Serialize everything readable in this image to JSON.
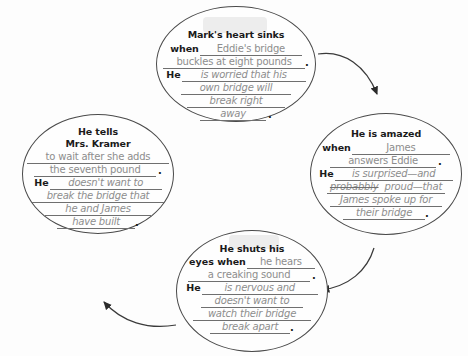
{
  "worksheet": {
    "title": "Character response graphic organizer",
    "arrow_color": "#3a3a3a",
    "bubble_border_color": "#4a4a4a",
    "handwriting_color": "#8d8d8d",
    "print_color": "#1a1a1a",
    "background_color": "#fdfdfd"
  },
  "bubbles": {
    "top": {
      "name": "marks-heart-sinks-bubble",
      "title": "Mark's heart sinks",
      "lines": [
        {
          "lead": "when",
          "fill": "Eddie's bridge",
          "style": "upright",
          "end": ""
        },
        {
          "lead": "",
          "fill": "buckles at eight pounds",
          "style": "upright",
          "end": "."
        },
        {
          "lead": "He",
          "fill": "is worried that his",
          "style": "italic",
          "end": ""
        },
        {
          "lead": "",
          "fill": "own bridge will",
          "style": "italic",
          "end": ""
        },
        {
          "lead": "",
          "fill": "break right",
          "style": "italic",
          "end": ""
        },
        {
          "lead": "",
          "fill": "away",
          "style": "italic",
          "end": "."
        }
      ]
    },
    "right": {
      "name": "he-is-amazed-bubble",
      "title": "He is amazed",
      "lines": [
        {
          "lead": "when",
          "fill": "James",
          "style": "upright",
          "end": ""
        },
        {
          "lead": "",
          "fill": "answers Eddie",
          "style": "upright",
          "end": "."
        },
        {
          "lead": "He",
          "fill": "is surprised—and",
          "style": "italic",
          "end": ""
        },
        {
          "lead": "",
          "fill": "probabbly",
          "style": "italic-struck",
          "fill2": "proud—that",
          "end": ""
        },
        {
          "lead": "",
          "fill": "James spoke up for",
          "style": "italic",
          "end": ""
        },
        {
          "lead": "",
          "fill": "their bridge",
          "style": "italic",
          "end": "."
        }
      ]
    },
    "bottom": {
      "name": "he-shuts-his-eyes-bubble",
      "title_line1": "He shuts his",
      "lines": [
        {
          "lead": "eyes when",
          "fill": "he hears",
          "style": "upright",
          "end": ""
        },
        {
          "lead": "",
          "fill": "a creaking sound",
          "style": "upright",
          "end": "."
        },
        {
          "lead": "He",
          "fill": "is nervous and",
          "style": "italic",
          "end": ""
        },
        {
          "lead": "",
          "fill": "doesn't want to",
          "style": "italic",
          "end": ""
        },
        {
          "lead": "",
          "fill": "watch their bridge",
          "style": "italic",
          "end": ""
        },
        {
          "lead": "",
          "fill": "break apart",
          "style": "italic",
          "end": "."
        }
      ]
    },
    "left": {
      "name": "he-tells-mrs-kramer-bubble",
      "title_line1": "He tells",
      "title_line2": "Mrs. Kramer",
      "lines": [
        {
          "lead": "",
          "fill": "to wait after she adds",
          "style": "upright",
          "end": ""
        },
        {
          "lead": "",
          "fill": "the seventh pound",
          "style": "upright",
          "end": "."
        },
        {
          "lead": "He",
          "fill": "doesn't want to",
          "style": "italic",
          "end": ""
        },
        {
          "lead": "",
          "fill": "break the bridge that",
          "style": "italic",
          "end": ""
        },
        {
          "lead": "",
          "fill": "he and James",
          "style": "italic",
          "end": ""
        },
        {
          "lead": "",
          "fill": "have built",
          "style": "italic",
          "end": "."
        }
      ]
    }
  },
  "arrows": [
    {
      "name": "arrow-top-to-right",
      "from": "top",
      "to": "right"
    },
    {
      "name": "arrow-right-to-bottom",
      "from": "right",
      "to": "bottom"
    },
    {
      "name": "arrow-bottom-to-left",
      "from": "bottom",
      "to": "left"
    }
  ]
}
